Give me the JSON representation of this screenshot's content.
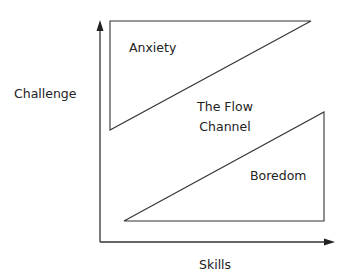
{
  "diagram": {
    "axes": {
      "y_label": "Challenge",
      "x_label": "Skills"
    },
    "regions": {
      "anxiety": "Anxiety",
      "flow_line1": "The Flow",
      "flow_line2": "Channel",
      "boredom": "Boredom"
    },
    "colors": {
      "line": "#333333",
      "text": "#222222",
      "background": "#ffffff"
    }
  }
}
